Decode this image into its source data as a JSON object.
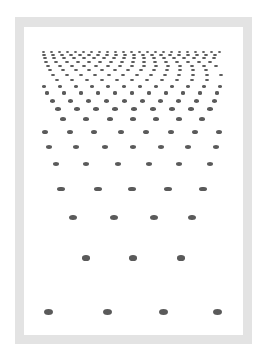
{
  "figure": {
    "frame_color": "#e3e3e3",
    "background_color": "#ffffff",
    "dot_color": "#5a5a5a",
    "rows": [
      {
        "y": 52,
        "w": 3.0,
        "h": 2.0,
        "xs": [
          43,
          51,
          59,
          67,
          75,
          83,
          91,
          99,
          107,
          115,
          123,
          131,
          139,
          147,
          155,
          163,
          171,
          179,
          187,
          195,
          203,
          211,
          219
        ]
      },
      {
        "y": 55,
        "w": 3.2,
        "h": 2.2,
        "xs": [
          44,
          53,
          62,
          71,
          80,
          89,
          98,
          107,
          116,
          125,
          134,
          143,
          152,
          161,
          170,
          179,
          188,
          197,
          206,
          215
        ]
      },
      {
        "y": 58,
        "w": 3.4,
        "h": 2.3,
        "xs": [
          45,
          54,
          64,
          74,
          84,
          94,
          104,
          114,
          124,
          134,
          144,
          154,
          164,
          174,
          184,
          194,
          204,
          214
        ]
      },
      {
        "y": 62,
        "w": 3.6,
        "h": 2.4,
        "xs": [
          46,
          56,
          67,
          78,
          89,
          100,
          111,
          122,
          133,
          144,
          155,
          166,
          177,
          188,
          199,
          210
        ]
      },
      {
        "y": 66,
        "w": 3.8,
        "h": 2.5,
        "xs": [
          48,
          60,
          72,
          84,
          96,
          108,
          120,
          132,
          144,
          156,
          168,
          180,
          192,
          204,
          216
        ]
      },
      {
        "y": 70,
        "w": 4.0,
        "h": 2.6,
        "xs": [
          50,
          63,
          76,
          89,
          102,
          115,
          128,
          141,
          154,
          167,
          180,
          193,
          206
        ]
      },
      {
        "y": 75,
        "w": 4.2,
        "h": 2.8,
        "xs": [
          53,
          67,
          81,
          95,
          109,
          123,
          137,
          151,
          165,
          179,
          193,
          207,
          221
        ]
      },
      {
        "y": 80,
        "w": 4.4,
        "h": 2.9,
        "xs": [
          57,
          72,
          87,
          102,
          117,
          132,
          147,
          162,
          177,
          192,
          207
        ]
      },
      {
        "y": 86,
        "w": 4.6,
        "h": 3.0,
        "xs": [
          44,
          60,
          76,
          92,
          108,
          124,
          140,
          156,
          172,
          188,
          204,
          220
        ]
      },
      {
        "y": 93,
        "w": 4.8,
        "h": 3.1,
        "xs": [
          47,
          64,
          81,
          98,
          115,
          132,
          149,
          166,
          183,
          200,
          217
        ]
      },
      {
        "y": 101,
        "w": 5.0,
        "h": 3.3,
        "xs": [
          52,
          70,
          88,
          106,
          124,
          142,
          160,
          178,
          196,
          214
        ]
      },
      {
        "y": 109,
        "w": 5.3,
        "h": 3.5,
        "xs": [
          58,
          77,
          96,
          115,
          134,
          153,
          172,
          191,
          210
        ]
      },
      {
        "y": 119,
        "w": 5.6,
        "h": 3.7,
        "xs": [
          63,
          86,
          110,
          133,
          156,
          179,
          202
        ]
      },
      {
        "y": 132,
        "w": 6.0,
        "h": 4.0,
        "xs": [
          45,
          70,
          94,
          121,
          146,
          171,
          195,
          219
        ]
      },
      {
        "y": 147,
        "w": 6.3,
        "h": 4.2,
        "xs": [
          49,
          76,
          105,
          133,
          161,
          188,
          216
        ]
      },
      {
        "y": 164,
        "w": 6.7,
        "h": 4.4,
        "xs": [
          56,
          86,
          118,
          149,
          179,
          210
        ]
      },
      {
        "y": 189,
        "w": 7.2,
        "h": 4.7,
        "xs": [
          61,
          98,
          132,
          168,
          203
        ]
      },
      {
        "y": 217,
        "w": 7.8,
        "h": 5.0,
        "xs": [
          73,
          114,
          154,
          192
        ]
      },
      {
        "y": 258,
        "w": 8.4,
        "h": 5.4,
        "xs": [
          86,
          133,
          181
        ]
      },
      {
        "y": 312,
        "w": 9.0,
        "h": 6.0,
        "xs": [
          48,
          107,
          163,
          217
        ]
      }
    ]
  }
}
